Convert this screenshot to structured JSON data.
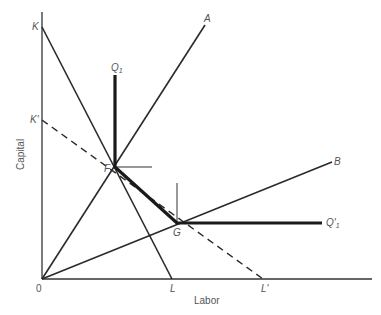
{
  "diagram": {
    "type": "isoquant-isocost",
    "axes": {
      "x_label": "Labor",
      "y_label": "Capital",
      "origin_label": "0"
    },
    "points": {
      "K": "K",
      "K_prime": "K'",
      "L": "L",
      "L_prime": "L'",
      "F": "F",
      "G": "G"
    },
    "rays": {
      "A": "A",
      "B": "B"
    },
    "isoquant": {
      "label_top": "Q",
      "label_top_sub": "1",
      "label_right": "Q'",
      "label_right_sub": "1"
    },
    "colors": {
      "line": "#2a2a2a",
      "text": "#555555"
    }
  }
}
